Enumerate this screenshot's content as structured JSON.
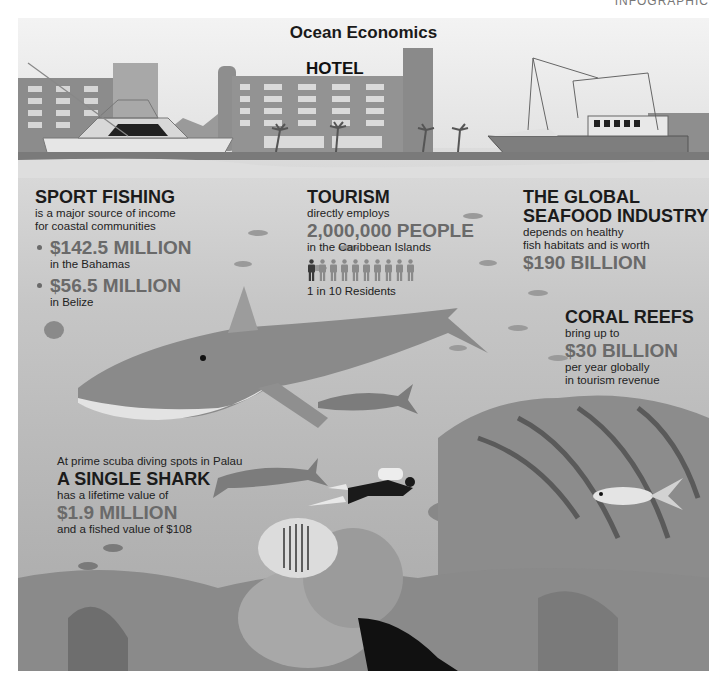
{
  "corner_label": "INFOGRAPHIC",
  "title": "Ocean Economics",
  "scene": {
    "hotel_sign": "HOTEL"
  },
  "sport_fishing": {
    "heading": "SPORT FISHING",
    "subtitle_1": "is a major source of income",
    "subtitle_2": "for coastal communities",
    "items": [
      {
        "value": "$142.5 MILLION",
        "location": "in the Bahamas"
      },
      {
        "value": "$56.5 MILLION",
        "location": "in Belize"
      }
    ]
  },
  "tourism": {
    "heading": "TOURISM",
    "line_1": "directly employs",
    "value": "2,000,000 PEOPLE",
    "line_2": "in the Caribbean Islands",
    "people_icons": {
      "total": 10,
      "highlighted": 1
    },
    "ratio": "1 in 10 Residents"
  },
  "seafood": {
    "heading_1": "THE GLOBAL",
    "heading_2": "SEAFOOD INDUSTRY",
    "line_1": "depends on healthy",
    "line_2": "fish habitats and is worth",
    "value": "$190 BILLION"
  },
  "coral_reefs": {
    "heading": "CORAL REEFS",
    "line_1": "bring up to",
    "value": "$30 BILLION",
    "line_2": "per year globally",
    "line_3": "in tourism revenue"
  },
  "shark": {
    "intro": "At prime scuba diving spots in Palau",
    "heading": "A SINGLE SHARK",
    "line_1": "has a lifetime value of",
    "value": "$1.9 MILLION",
    "line_2": "and a fished value of $108"
  },
  "colors": {
    "accent_value": "#6a6a6a",
    "heading": "#1b1b1b",
    "sea": "#bdbdbd",
    "sky": "#ececec"
  }
}
